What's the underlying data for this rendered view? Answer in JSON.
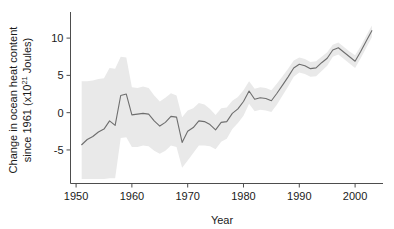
{
  "chart_data": {
    "type": "line",
    "title": "",
    "xlabel": "Year",
    "ylabel_line1": "Change in ocean heat content",
    "ylabel_line2_pre": "since 1961 (x10",
    "ylabel_line2_sup": "21",
    "ylabel_line2_post": " Joules)",
    "ylabel_full": "Change in ocean heat content since 1961 (x10^21 Joules)",
    "xlim": [
      1949.0,
      2005.0
    ],
    "ylim": [
      -9.5,
      13.5
    ],
    "xticks": [
      1950,
      1960,
      1970,
      1980,
      1990,
      2000
    ],
    "xtick_labels": [
      "1950",
      "1960",
      "1970",
      "1980",
      "1990",
      "2000"
    ],
    "yticks": [
      -5,
      0,
      5,
      10
    ],
    "ytick_labels": [
      "-5",
      "0",
      "5",
      "10"
    ],
    "grid": false,
    "legend": null,
    "line_color": "#6e6e6e",
    "band_color": "#e9e9e9",
    "axis_color": "#4d4d4d",
    "x": [
      1951,
      1952,
      1953,
      1954,
      1955,
      1956,
      1957,
      1958,
      1959,
      1960,
      1961,
      1962,
      1963,
      1964,
      1965,
      1966,
      1967,
      1968,
      1969,
      1970,
      1971,
      1972,
      1973,
      1974,
      1975,
      1976,
      1977,
      1978,
      1979,
      1980,
      1981,
      1982,
      1983,
      1984,
      1985,
      1986,
      1987,
      1988,
      1989,
      1990,
      1991,
      1992,
      1993,
      1994,
      1995,
      1996,
      1997,
      1998,
      1999,
      2000,
      2001,
      2002,
      2003
    ],
    "series": [
      {
        "name": "Ocean heat content anomaly",
        "values": [
          -4.3,
          -3.6,
          -3.2,
          -2.6,
          -2.2,
          -1.1,
          -1.7,
          2.3,
          2.5,
          -0.3,
          -0.2,
          -0.1,
          -0.2,
          -1.1,
          -1.8,
          -1.3,
          -0.5,
          -0.6,
          -4.0,
          -2.5,
          -2.0,
          -1.1,
          -1.2,
          -1.6,
          -2.3,
          -1.3,
          -1.2,
          -0.1,
          0.5,
          1.5,
          2.9,
          1.8,
          2.0,
          1.9,
          1.6,
          2.6,
          3.7,
          4.8,
          6.0,
          6.5,
          6.3,
          5.9,
          6.0,
          6.7,
          7.3,
          8.4,
          8.7,
          8.1,
          7.5,
          6.9,
          8.2,
          9.6,
          11.0
        ]
      }
    ],
    "uncertainty_band": {
      "name": "90% uncertainty range",
      "upper": [
        4.2,
        4.2,
        4.3,
        4.5,
        4.6,
        6.0,
        5.9,
        7.5,
        7.4,
        3.4,
        3.3,
        3.5,
        3.3,
        2.3,
        1.5,
        2.0,
        2.6,
        2.3,
        -0.6,
        0.3,
        0.6,
        1.3,
        1.1,
        0.5,
        -0.3,
        0.6,
        0.7,
        1.6,
        2.1,
        3.0,
        4.2,
        3.2,
        3.4,
        3.3,
        3.0,
        3.9,
        4.9,
        5.9,
        7.0,
        7.4,
        7.2,
        6.8,
        6.9,
        7.5,
        8.1,
        9.1,
        9.4,
        8.8,
        8.2,
        7.7,
        8.9,
        10.3,
        11.7
      ],
      "lower": [
        -8.9,
        -8.9,
        -8.9,
        -8.9,
        -8.9,
        -8.8,
        -8.8,
        -3.4,
        -3.3,
        -4.6,
        -4.6,
        -4.4,
        -4.5,
        -5.1,
        -5.5,
        -5.1,
        -4.4,
        -4.6,
        -7.4,
        -6.4,
        -5.4,
        -4.4,
        -4.4,
        -4.5,
        -4.9,
        -3.9,
        -3.5,
        -2.2,
        -1.4,
        -0.4,
        1.2,
        0.2,
        0.4,
        0.3,
        0.1,
        1.1,
        2.3,
        3.5,
        4.8,
        5.4,
        5.2,
        4.8,
        4.9,
        5.6,
        6.3,
        7.5,
        7.8,
        7.2,
        6.6,
        6.0,
        7.3,
        8.7,
        10.1
      ]
    }
  }
}
